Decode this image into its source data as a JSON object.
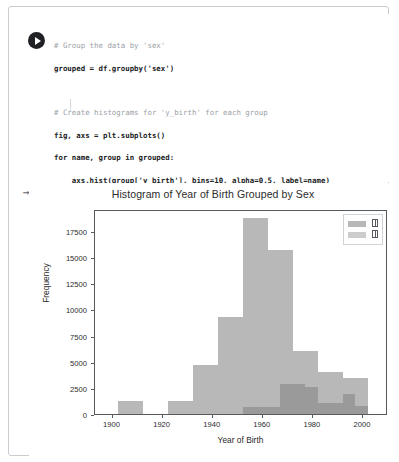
{
  "cell": {
    "run_button_icon": "play-icon",
    "output_marker": "output-prompt-icon",
    "output_marker_glyph": "→"
  },
  "code": {
    "lines": [
      "# Group the data by 'sex'",
      "grouped = df.groupby('sex')",
      "",
      "# Create histograms for 'y_birth' for each group",
      "fig, axs = plt.subplots()",
      "for name, group in grouped:",
      "    axs.hist(group['y_birth'], bins=10, alpha=0.5, label=name)",
      "",
      "axs.set_xlabel('Year of Birth')",
      "axs.set_ylabel('Frequency')",
      "axs.set_title('Histogram of Year of Birth Grouped by Sex')",
      "axs.legend()",
      "plt.show()"
    ]
  },
  "chart_data": {
    "type": "bar",
    "title": "Histogram of Year of Birth Grouped by Sex",
    "xlabel": "Year of Birth",
    "ylabel": "Frequency",
    "xlim": [
      1893,
      2010
    ],
    "ylim": [
      0,
      19600
    ],
    "xticks": [
      1900,
      1920,
      1940,
      1960,
      1980,
      2000
    ],
    "yticks": [
      0,
      2500,
      5000,
      7500,
      10000,
      12500,
      15000,
      17500
    ],
    "grid": false,
    "legend_position": "upper right",
    "bin_width": 10,
    "colors": {
      "series1": "#b8b8b8",
      "series2": "#9a9a9a",
      "axis": "#555a5f",
      "text": "#2b2b2b"
    },
    "series": [
      {
        "name": "□",
        "label_note": "missing-glyph-box",
        "color": "#b8b8b8",
        "bin_edges": [
          1902,
          1912,
          1922,
          1932,
          1942,
          1952,
          1962,
          1972,
          1982,
          1992,
          2002
        ],
        "values": [
          1250,
          0,
          1200,
          4700,
          9250,
          18700,
          15700,
          6000,
          4050,
          3400
        ]
      },
      {
        "name": "□",
        "label_note": "missing-glyph-box",
        "color": "#9a9a9a",
        "bin_edges": [
          1952,
          1962,
          1967,
          1972,
          1977,
          1982,
          1992,
          1997,
          2002
        ],
        "values": [
          700,
          700,
          2900,
          2900,
          2600,
          1100,
          1900,
          800
        ]
      }
    ]
  }
}
